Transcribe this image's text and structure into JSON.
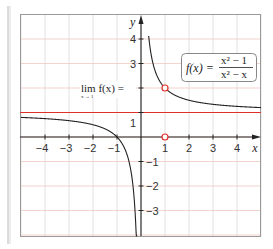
{
  "chart_data": {
    "type": "line",
    "title": "",
    "xlabel": "x",
    "ylabel": "y",
    "xlim": [
      -5,
      5
    ],
    "ylim": [
      -4,
      5
    ],
    "x_ticks": [
      -4,
      -3,
      -2,
      -1,
      1,
      2,
      3,
      4
    ],
    "y_ticks": [
      -3,
      -2,
      -1,
      1,
      2,
      3,
      4
    ],
    "grid": true,
    "function_label": {
      "lhs": "f(x) =",
      "numerator": "x² − 1",
      "denominator": "x² − x"
    },
    "limit_label": {
      "text": "lim f(x) =",
      "subscript": "x → 1",
      "value": "2"
    },
    "series": [
      {
        "name": "f(x) = (x^2-1)/(x^2-x)",
        "expression": "1 + 1/x",
        "vertical_asymptote": 0,
        "color": "#222222"
      }
    ],
    "horizontal_asymptote": {
      "y": 1,
      "color": "#e0302a"
    },
    "open_points": [
      {
        "x": 1,
        "y": 2,
        "color": "#e0302a"
      },
      {
        "x": 1,
        "y": 0,
        "color": "#e0302a"
      }
    ]
  },
  "colors": {
    "grid": "#d9d9d9",
    "grid_red": "#f0c8c0",
    "axis": "#222222",
    "accent": "#e0302a",
    "frame": "#9a9a9a"
  }
}
